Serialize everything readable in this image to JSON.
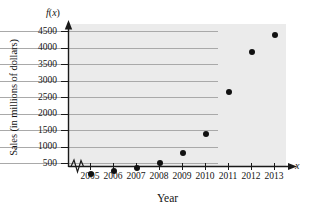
{
  "chart_data": {
    "type": "scatter",
    "title": "",
    "xlabel": "Year",
    "ylabel": "Sales (in millions of dollars)",
    "x_axis_variable": "x",
    "y_axis_variable": "f(x)",
    "categories": [
      "2005",
      "2006",
      "2007",
      "2008",
      "2009",
      "2010",
      "2011",
      "2012",
      "2013"
    ],
    "x": [
      2005,
      2006,
      2007,
      2008,
      2009,
      2010,
      2011,
      2012,
      2013
    ],
    "values": [
      180,
      250,
      360,
      500,
      800,
      1370,
      2650,
      3870,
      4380
    ],
    "xlim": [
      2004.4,
      2013.6
    ],
    "ylim": [
      0,
      4750
    ],
    "yticks": [
      500,
      1000,
      1500,
      2000,
      2500,
      3000,
      3500,
      4000,
      4500
    ],
    "ytick_labels": [
      "500",
      "1000",
      "1500",
      "2000",
      "2500",
      "3000",
      "3500",
      "4000",
      "4500"
    ],
    "xticks": [
      2005,
      2006,
      2007,
      2008,
      2009,
      2010,
      2011,
      2012,
      2013
    ],
    "xtick_labels": [
      "2005",
      "2006",
      "2007",
      "2008",
      "2009",
      "2010",
      "2011",
      "2012",
      "2013"
    ],
    "grid": true,
    "grid_axis": "y",
    "legend": false,
    "legend_position": "none",
    "axis_break_x": true,
    "marker": "filled-circle",
    "marker_color": "#111111",
    "plot_background": "#ebebeb",
    "gridline_color": "#a9a9a9",
    "axis_color": "#1a1a1a"
  },
  "labels": {
    "y_axis_title": "Sales (in millions of dollars)",
    "x_axis_title": "Year",
    "function_label_f": "f",
    "function_label_open": "(",
    "function_label_var": "x",
    "function_label_close": ")",
    "x_variable": "x"
  }
}
